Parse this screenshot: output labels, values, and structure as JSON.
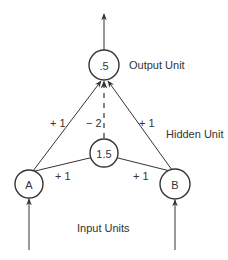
{
  "diagram": {
    "nodes": {
      "output": {
        "value": ".5",
        "label": "Output Unit"
      },
      "hidden": {
        "value": "1.5",
        "label": "Hidden Unit"
      },
      "input_a": {
        "value": "A"
      },
      "input_b": {
        "value": "B"
      }
    },
    "inputs_label": "Input Units",
    "weights": {
      "a_to_output": "+ 1",
      "b_to_output": "+ 1",
      "hidden_to_output": "− 2",
      "a_to_hidden": "+ 1",
      "b_to_hidden": "+ 1"
    }
  }
}
